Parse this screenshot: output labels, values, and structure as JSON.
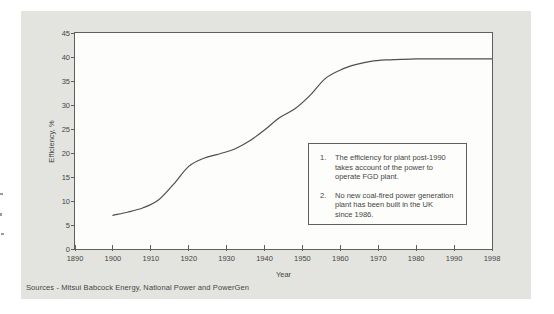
{
  "colors": {
    "panel_bg": "#e3e4e0",
    "plot_bg": "#fdfdfb",
    "axis": "#5f5f5c",
    "line": "#4f4f4d",
    "text": "#454543"
  },
  "chart_data": {
    "type": "line",
    "title": "",
    "xlabel": "Year",
    "ylabel": "Efficiency, %",
    "x_tick_labels": [
      "1890",
      "1900",
      "1910",
      "1920",
      "1930",
      "1940",
      "1950",
      "1960",
      "1970",
      "1980",
      "1990",
      "1998"
    ],
    "y_tick_values": [
      0,
      5,
      10,
      15,
      20,
      25,
      30,
      35,
      40,
      45
    ],
    "ylim": [
      0,
      45
    ],
    "xlim_years": [
      1890,
      1998
    ],
    "grid": "off",
    "layout_note": "x ticks evenly spaced; final interval spans only 1990-1998",
    "series": [
      {
        "name": "UK coal-fired plant efficiency",
        "points": [
          [
            1900,
            7.0
          ],
          [
            1904,
            7.7
          ],
          [
            1908,
            8.6
          ],
          [
            1912,
            10.2
          ],
          [
            1916,
            13.5
          ],
          [
            1920,
            17.2
          ],
          [
            1924,
            18.9
          ],
          [
            1928,
            19.8
          ],
          [
            1932,
            20.8
          ],
          [
            1936,
            22.5
          ],
          [
            1940,
            24.8
          ],
          [
            1944,
            27.4
          ],
          [
            1948,
            29.2
          ],
          [
            1952,
            32.0
          ],
          [
            1956,
            35.5
          ],
          [
            1960,
            37.3
          ],
          [
            1964,
            38.4
          ],
          [
            1968,
            39.1
          ],
          [
            1972,
            39.4
          ],
          [
            1976,
            39.5
          ],
          [
            1980,
            39.6
          ],
          [
            1985,
            39.6
          ],
          [
            1990,
            39.6
          ],
          [
            1998,
            39.6
          ]
        ]
      }
    ]
  },
  "notes_box": {
    "items": [
      {
        "number": "1.",
        "lines": [
          "The efficiency for plant post-1990",
          "takes account of the power to",
          "operate FGD plant."
        ]
      },
      {
        "number": "2.",
        "lines": [
          "No new coal-fired power generation",
          "plant has been built in the UK",
          "since 1986."
        ]
      }
    ]
  },
  "footer": {
    "source": "Sources - Mitsui Babcock Energy, National Power and PowerGen"
  }
}
